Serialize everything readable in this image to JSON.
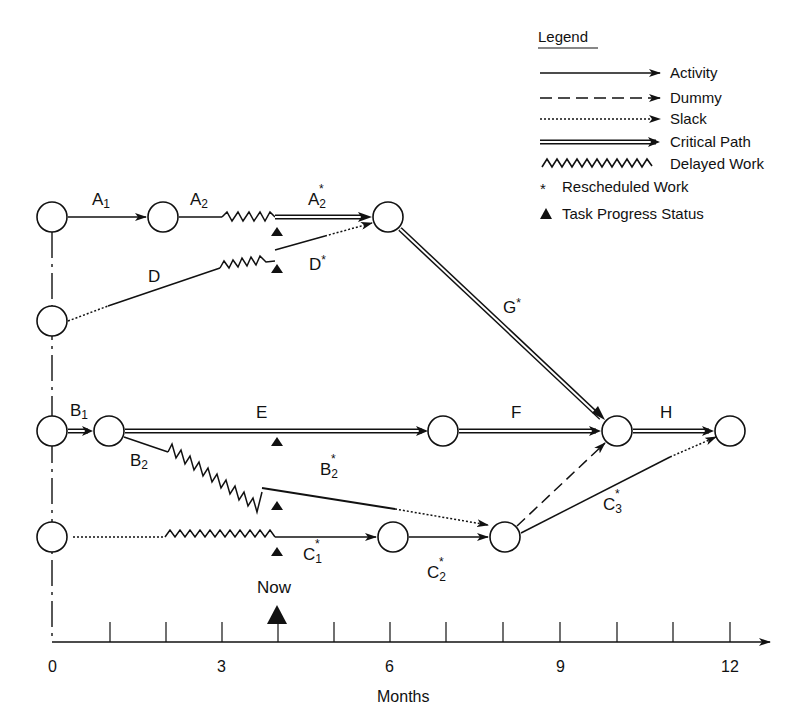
{
  "legend": {
    "title": "Legend",
    "items": [
      {
        "style": "activity",
        "label": "Activity"
      },
      {
        "style": "dummy",
        "label": "Dummy"
      },
      {
        "style": "slack",
        "label": "Slack"
      },
      {
        "style": "critical-path",
        "label": "Critical Path"
      },
      {
        "style": "delayed-work",
        "label": "Delayed Work"
      },
      {
        "style": "rescheduled-marker",
        "symbol": "*",
        "label": "Rescheduled Work"
      },
      {
        "style": "progress-marker",
        "symbol": "▲",
        "label": "Task Progress Status"
      }
    ]
  },
  "activities": {
    "A1": {
      "base": "A",
      "sub": "1",
      "star": ""
    },
    "A2": {
      "base": "A",
      "sub": "2",
      "star": ""
    },
    "A2s": {
      "base": "A",
      "sub": "2",
      "star": "*"
    },
    "D": {
      "base": "D",
      "sub": "",
      "star": ""
    },
    "Ds": {
      "base": "D",
      "sub": "",
      "star": "*"
    },
    "Gs": {
      "base": "G",
      "sub": "",
      "star": "*"
    },
    "B1": {
      "base": "B",
      "sub": "1",
      "star": ""
    },
    "E": {
      "base": "E",
      "sub": "",
      "star": ""
    },
    "F": {
      "base": "F",
      "sub": "",
      "star": ""
    },
    "H": {
      "base": "H",
      "sub": "",
      "star": ""
    },
    "B2": {
      "base": "B",
      "sub": "2",
      "star": ""
    },
    "B2s": {
      "base": "B",
      "sub": "2",
      "star": "*"
    },
    "C1s": {
      "base": "C",
      "sub": "1",
      "star": "*"
    },
    "C2s": {
      "base": "C",
      "sub": "2",
      "star": "*"
    },
    "C3s": {
      "base": "C",
      "sub": "3",
      "star": "*"
    }
  },
  "now_marker": {
    "label": "Now",
    "month": 4
  },
  "axis": {
    "label": "Months",
    "range": [
      0,
      12
    ],
    "tick_step": 1,
    "tick_labels": [
      "0",
      "3",
      "6",
      "9",
      "12"
    ]
  }
}
